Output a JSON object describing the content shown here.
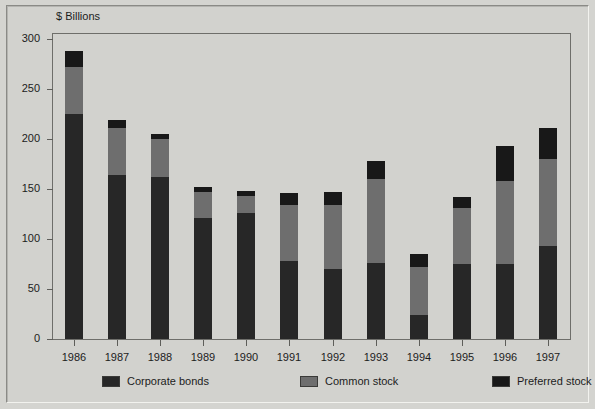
{
  "chart_data": {
    "type": "bar",
    "stacked": true,
    "title": "",
    "subtitle": "",
    "ylabel": "$ Billions",
    "xlabel": "",
    "ylim": [
      0,
      300
    ],
    "yticks": [
      0,
      50,
      100,
      150,
      200,
      250,
      300
    ],
    "ytick_labels": [
      "0",
      "50",
      "100",
      "150",
      "200",
      "250",
      "300"
    ],
    "grid": false,
    "legend_position": "bottom",
    "categories": [
      "1986",
      "1987",
      "1988",
      "1989",
      "1990",
      "1991",
      "1992",
      "1993",
      "1994",
      "1995",
      "1996",
      "1997"
    ],
    "series": [
      {
        "name": "Corporate bonds",
        "color": "#272727",
        "values": [
          225,
          164,
          162,
          121,
          126,
          78,
          70,
          76,
          24,
          75,
          75,
          93
        ]
      },
      {
        "name": "Common stock",
        "color": "#6e6e6e",
        "values": [
          47,
          47,
          38,
          26,
          17,
          56,
          64,
          84,
          48,
          56,
          83,
          87
        ]
      },
      {
        "name": "Preferred stock",
        "color": "#181818",
        "values": [
          16,
          8,
          5,
          5,
          5,
          12,
          13,
          18,
          13,
          11,
          35,
          31
        ]
      }
    ],
    "totals": [
      288,
      219,
      205,
      152,
      148,
      146,
      147,
      178,
      85,
      142,
      193,
      211
    ]
  },
  "legend": {
    "items": [
      {
        "label": "Corporate bonds",
        "color": "#272727"
      },
      {
        "label": "Common stock",
        "color": "#6e6e6e"
      },
      {
        "label": "Preferred stock",
        "color": "#181818"
      }
    ]
  },
  "colors": {
    "background": "#d4d4d0",
    "axis": "#6e6e6a",
    "text": "#1c1c1c"
  }
}
